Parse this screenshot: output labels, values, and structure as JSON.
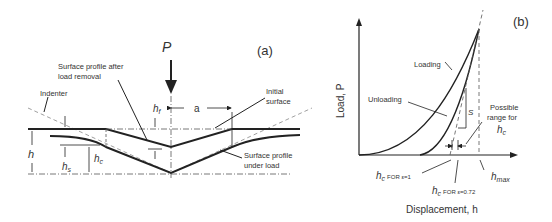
{
  "panel_a": {
    "label": "(a)",
    "load_symbol": "P",
    "labels": {
      "after_removal_1": "Surface profile after",
      "after_removal_2": "load removal",
      "indenter": "Indenter",
      "initial_1": "Initial",
      "initial_2": "surface",
      "under_load_1": "Surface profile",
      "under_load_2": "under load",
      "a": "a",
      "h": "h",
      "hf": "h",
      "hf_sub": "f",
      "hs": "h",
      "hs_sub": "s",
      "hc": "h",
      "hc_sub": "c"
    }
  },
  "panel_b": {
    "label": "(b)",
    "y_axis_label": "Load, P",
    "x_axis_label": "Displacement, h",
    "loading": "Loading",
    "unloading": "Unloading",
    "stiffness": "S",
    "possible_1": "Possible",
    "possible_2": "range for",
    "possible_3": "h",
    "possible_3_sub": "c",
    "hc1": "h",
    "hc1_sub": "c",
    "hc1_rest": "FOR ε=1",
    "hc2": "h",
    "hc2_sub": "c",
    "hc2_rest": "FOR ε=0.72",
    "hmax": "h",
    "hmax_sub": "max"
  }
}
